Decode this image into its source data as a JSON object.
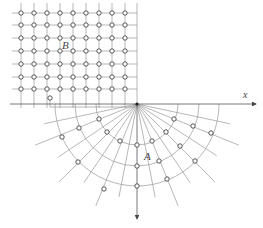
{
  "diagram": {
    "labels": {
      "region_b": "B",
      "region_a": "A",
      "x_axis": "x"
    },
    "colors": {
      "line": "#9a9a9a",
      "axis": "#555555",
      "node_stroke": "#444444",
      "background": "#ffffff"
    },
    "origin": [
      137,
      104
    ],
    "grid": {
      "columns_x": [
        21,
        34,
        47,
        60,
        73,
        86,
        99,
        112,
        125
      ],
      "rows_y": [
        13,
        25,
        38,
        51,
        64,
        77,
        89
      ],
      "right_edge_x": 137,
      "top_y": 3
    },
    "extra_node": [
      50,
      98
    ],
    "polar": {
      "radii": [
        41,
        62,
        82
      ],
      "ray_angles_deg": [
        12,
        22,
        33,
        45,
        56,
        68,
        79,
        90,
        101,
        112,
        124,
        135,
        146,
        158,
        168
      ],
      "nodes": [
        [
          174,
          119
        ],
        [
          193,
          126
        ],
        [
          211,
          133
        ],
        [
          166,
          132
        ],
        [
          180,
          146
        ],
        [
          195,
          161
        ],
        [
          152,
          141
        ],
        [
          159,
          161
        ],
        [
          167,
          179
        ],
        [
          137,
          145
        ],
        [
          137,
          166
        ],
        [
          137,
          186
        ],
        [
          99,
          119
        ],
        [
          79,
          128
        ],
        [
          62,
          137
        ],
        [
          107,
          132
        ],
        [
          78,
          162
        ],
        [
          120,
          141
        ],
        [
          104,
          189
        ]
      ]
    }
  }
}
